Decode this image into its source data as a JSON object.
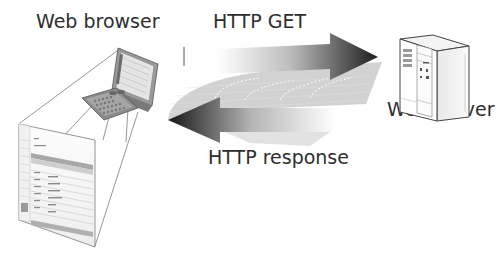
{
  "diagram": {
    "type": "client-server request/response",
    "nodes": [
      {
        "id": "client",
        "label": "Web browser",
        "icon": "handheld-pda-icon"
      },
      {
        "id": "server",
        "label": "Web server",
        "icon": "tower-server-icon"
      }
    ],
    "edges": [
      {
        "from": "client",
        "to": "server",
        "label": "HTTP GET",
        "direction": "right"
      },
      {
        "from": "server",
        "to": "client",
        "label": "HTTP response",
        "direction": "left"
      }
    ],
    "colors": {
      "arrow_dark": "#1a1a1a",
      "arrow_light": "#ffffff",
      "band_gray": "#c8c8c8",
      "text": "#2e2e2e",
      "outline": "#6a6a6a"
    }
  },
  "labels": {
    "browser": "Web browser",
    "get": "HTTP GET",
    "response": "HTTP response",
    "server": "Web server"
  }
}
